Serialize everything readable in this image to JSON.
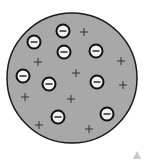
{
  "diagram": {
    "title": "",
    "atom": {
      "cx": 72,
      "cy": 78,
      "r": 65,
      "fill": "#a8a8a8",
      "stroke": "#1a1a1a"
    },
    "electrons": [
      {
        "x": 63,
        "y": 31
      },
      {
        "x": 34,
        "y": 42
      },
      {
        "x": 64,
        "y": 52
      },
      {
        "x": 96,
        "y": 51
      },
      {
        "x": 23,
        "y": 76
      },
      {
        "x": 49,
        "y": 84
      },
      {
        "x": 97,
        "y": 82
      },
      {
        "x": 58,
        "y": 117
      },
      {
        "x": 107,
        "y": 114
      }
    ],
    "positive_charges": [
      {
        "x": 84,
        "y": 32
      },
      {
        "x": 38,
        "y": 62
      },
      {
        "x": 121,
        "y": 61
      },
      {
        "x": 76,
        "y": 73
      },
      {
        "x": 123,
        "y": 85
      },
      {
        "x": 25,
        "y": 97
      },
      {
        "x": 71,
        "y": 99
      },
      {
        "x": 39,
        "y": 125
      },
      {
        "x": 89,
        "y": 129
      }
    ],
    "electron_symbol": "−",
    "positive_symbol": "+",
    "corner_marker": {
      "x": 137,
      "y": 155,
      "color": "#c8c8c8"
    }
  }
}
